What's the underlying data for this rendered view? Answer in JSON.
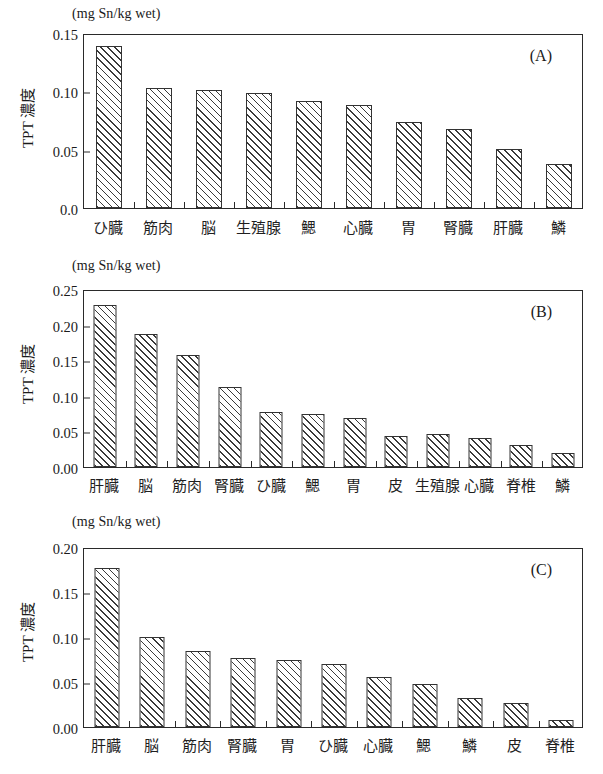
{
  "figure": {
    "units_label": "(mg Sn/kg wet)",
    "y_axis_title": "TPT 濃度"
  },
  "chart_data": [
    {
      "type": "bar",
      "panel": "(A)",
      "title": "",
      "xlabel": "",
      "ylabel": "TPT 濃度",
      "units": "(mg Sn/kg wet)",
      "ylim": [
        0.0,
        0.15
      ],
      "yticks": [
        0.0,
        0.05,
        0.1,
        0.15
      ],
      "ytick_labels": [
        "0.0",
        "0.05",
        "0.10",
        "0.15"
      ],
      "grid": false,
      "legend": "none",
      "categories": [
        "ひ臓",
        "筋肉",
        "脳",
        "生殖腺",
        "鰓",
        "心臓",
        "胃",
        "腎臓",
        "肝臓",
        "鱗"
      ],
      "values": [
        0.139,
        0.103,
        0.101,
        0.099,
        0.092,
        0.088,
        0.074,
        0.068,
        0.051,
        0.038
      ]
    },
    {
      "type": "bar",
      "panel": "(B)",
      "title": "",
      "xlabel": "",
      "ylabel": "TPT 濃度",
      "units": "(mg Sn/kg wet)",
      "ylim": [
        0.0,
        0.25
      ],
      "yticks": [
        0.0,
        0.05,
        0.1,
        0.15,
        0.2,
        0.25
      ],
      "ytick_labels": [
        "0.00",
        "0.05",
        "0.10",
        "0.15",
        "0.20",
        "0.25"
      ],
      "grid": false,
      "legend": "none",
      "categories": [
        "肝臓",
        "脳",
        "筋肉",
        "腎臓",
        "ひ臓",
        "鰓",
        "胃",
        "皮",
        "生殖腺",
        "心臓",
        "脊椎",
        "鱗"
      ],
      "values": [
        0.227,
        0.187,
        0.157,
        0.112,
        0.077,
        0.075,
        0.069,
        0.043,
        0.046,
        0.041,
        0.031,
        0.02
      ]
    },
    {
      "type": "bar",
      "panel": "(C)",
      "title": "",
      "xlabel": "",
      "ylabel": "TPT 濃度",
      "units": "(mg Sn/kg wet)",
      "ylim": [
        0.0,
        0.2
      ],
      "yticks": [
        0.0,
        0.05,
        0.1,
        0.15,
        0.2
      ],
      "ytick_labels": [
        "0.00",
        "0.05",
        "0.10",
        "0.15",
        "0.20"
      ],
      "grid": false,
      "legend": "none",
      "categories": [
        "肝臓",
        "脳",
        "筋肉",
        "腎臓",
        "胃",
        "ひ臓",
        "心臓",
        "鰓",
        "鱗",
        "皮",
        "脊椎"
      ],
      "values": [
        0.177,
        0.1,
        0.084,
        0.077,
        0.074,
        0.07,
        0.056,
        0.048,
        0.032,
        0.027,
        0.008
      ]
    }
  ]
}
